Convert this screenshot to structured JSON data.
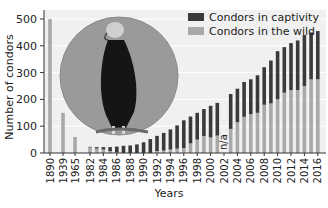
{
  "chart_data": {
    "type": "bar",
    "stacked": true,
    "title": "",
    "xlabel": "Years",
    "ylabel": "Number of condors",
    "ylim": [
      0,
      520
    ],
    "yticks": [
      0,
      100,
      200,
      300,
      400,
      500
    ],
    "legend_position": "top-right",
    "legend": [
      "Condors in captivity",
      "Condors in the wild"
    ],
    "colors": {
      "captivity": "#3a3a3a",
      "wild": "#a9a9a9"
    },
    "categories": [
      "1890",
      "1939",
      "1965",
      "1982",
      "1983",
      "1984",
      "1985",
      "1986",
      "1987",
      "1988",
      "1989",
      "1990",
      "1991",
      "1992",
      "1993",
      "1994",
      "1995",
      "1996",
      "1997",
      "1998",
      "1999",
      "2000",
      "2001",
      "2002",
      "2003",
      "2004",
      "2005",
      "2006",
      "2007",
      "2008",
      "2009",
      "2010",
      "2011",
      "2012",
      "2013",
      "2014",
      "2015",
      "2016"
    ],
    "x_tick_labels": [
      "1890",
      "1939",
      "1965",
      "1982",
      "1984",
      "1986",
      "1988",
      "1990",
      "1992",
      "1994",
      "1996",
      "1998",
      "2000",
      "2002",
      "2004",
      "2006",
      "2008",
      "2010",
      "2012",
      "2014",
      "2016"
    ],
    "series": [
      {
        "name": "Condors in the wild",
        "values": [
          500,
          150,
          60,
          21,
          17,
          13,
          7,
          2,
          0,
          0,
          0,
          0,
          0,
          7,
          9,
          13,
          16,
          18,
          36,
          50,
          63,
          58,
          65,
          null,
          90,
          115,
          135,
          145,
          150,
          180,
          185,
          200,
          225,
          235,
          235,
          250,
          275,
          275
        ]
      },
      {
        "name": "Condors in captivity",
        "values": [
          0,
          0,
          0,
          2,
          5,
          9,
          15,
          22,
          27,
          28,
          32,
          40,
          52,
          57,
          66,
          75,
          87,
          104,
          100,
          100,
          101,
          118,
          122,
          null,
          130,
          125,
          130,
          130,
          140,
          140,
          160,
          180,
          170,
          175,
          185,
          190,
          175,
          180
        ]
      }
    ],
    "annotations": [
      {
        "category": "2002",
        "text": "n/a"
      }
    ],
    "inset_image": "california-condor-photo"
  },
  "axes": {
    "ylabel": "Number of condors",
    "xlabel": "Years"
  },
  "legend": {
    "captivity": "Condors in captivity",
    "wild": "Condors in the wild"
  }
}
